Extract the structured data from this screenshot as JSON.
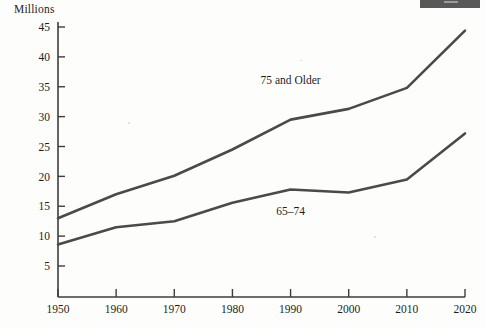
{
  "chart_data": {
    "type": "line",
    "title": "",
    "ylabel": "Millions",
    "xlabel": "",
    "ylim": [
      0,
      46.5
    ],
    "xlim": [
      1950,
      2020
    ],
    "yticks": [
      5,
      10,
      15,
      20,
      25,
      30,
      35,
      40,
      45
    ],
    "ytick_labels": [
      "5",
      "10",
      "15",
      "20",
      "25",
      "30",
      "35",
      "40",
      "45"
    ],
    "grid": false,
    "legend_position": "inline-annotation",
    "x": [
      1950,
      1960,
      1970,
      1980,
      1990,
      2000,
      2010,
      2020
    ],
    "categories": [
      "1950",
      "1960",
      "1970",
      "1980",
      "1990",
      "2000",
      "2010",
      "2020"
    ],
    "series": [
      {
        "name": "75 and Older",
        "values": [
          13.0,
          17.0,
          20.1,
          24.5,
          29.5,
          31.3,
          34.8,
          44.4
        ],
        "label_x": 1990,
        "label_y": 35.5
      },
      {
        "name": "65-74",
        "values": [
          8.6,
          11.5,
          12.5,
          15.6,
          17.8,
          17.3,
          19.5,
          27.2
        ],
        "label_x": 1990,
        "label_y": 13.5
      }
    ]
  },
  "axis": {
    "y_title": "Millions"
  },
  "annotations": {
    "upper_series_label": "75 and Older",
    "lower_series_label": "65–74"
  },
  "artifact": {
    "name": "scan-shadow-bar"
  },
  "colors": {
    "ink": "#1d1d1d",
    "line": "#4a4a4a",
    "axis": "#3d3d3d",
    "paper": "#fdfdfb",
    "artifact": "#585858"
  }
}
